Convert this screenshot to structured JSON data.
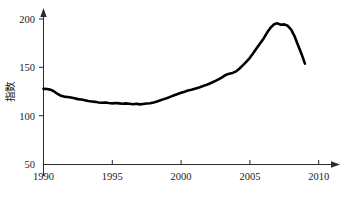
{
  "chart_data": {
    "type": "line",
    "title": "",
    "subtitle": "",
    "xlabel": "",
    "ylabel": "指数",
    "xlim": [
      1990,
      2010
    ],
    "ylim": [
      50,
      200
    ],
    "x_ticks": [
      1990,
      1995,
      2000,
      2005,
      2010
    ],
    "x_tick_labels": [
      "1990",
      "1995",
      "2000",
      "2005",
      "2010"
    ],
    "y_ticks": [
      50,
      100,
      150,
      200
    ],
    "y_tick_labels": [
      "50",
      "100",
      "150",
      "200"
    ],
    "grid": false,
    "legend": false,
    "legend_position": "none",
    "line_color": "#000000",
    "axis_color": "#2b2b2b",
    "series": [
      {
        "name": "指数",
        "x": [
          1990.0,
          1990.25,
          1990.5,
          1990.75,
          1991.0,
          1991.25,
          1991.5,
          1991.75,
          1992.0,
          1992.25,
          1992.5,
          1992.75,
          1993.0,
          1993.25,
          1993.5,
          1993.75,
          1994.0,
          1994.25,
          1994.5,
          1994.75,
          1995.0,
          1995.25,
          1995.5,
          1995.75,
          1996.0,
          1996.25,
          1996.5,
          1996.75,
          1997.0,
          1997.25,
          1997.5,
          1997.75,
          1998.0,
          1998.25,
          1998.5,
          1998.75,
          1999.0,
          1999.25,
          1999.5,
          1999.75,
          2000.0,
          2000.25,
          2000.5,
          2000.75,
          2001.0,
          2001.25,
          2001.5,
          2001.75,
          2002.0,
          2002.25,
          2002.5,
          2002.75,
          2003.0,
          2003.25,
          2003.5,
          2003.75,
          2004.0,
          2004.25,
          2004.5,
          2004.75,
          2005.0,
          2005.25,
          2005.5,
          2005.75,
          2006.0,
          2006.25,
          2006.5,
          2006.75,
          2007.0,
          2007.25,
          2007.5,
          2007.75,
          2008.0,
          2008.25,
          2008.5,
          2008.75,
          2009.0
        ],
        "values": [
          128.0,
          127.8,
          127.2,
          125.5,
          123.0,
          121.0,
          120.0,
          119.6,
          119.0,
          118.2,
          117.4,
          117.0,
          116.2,
          115.4,
          115.0,
          114.6,
          114.0,
          113.6,
          114.0,
          113.4,
          113.0,
          113.4,
          113.0,
          112.6,
          113.0,
          112.6,
          112.2,
          112.6,
          112.0,
          112.4,
          112.8,
          113.2,
          114.0,
          115.0,
          116.2,
          117.4,
          118.6,
          120.0,
          121.4,
          122.6,
          124.0,
          125.0,
          126.2,
          127.0,
          128.0,
          129.0,
          130.4,
          131.6,
          133.0,
          134.6,
          136.2,
          138.0,
          140.0,
          142.4,
          143.6,
          144.4,
          146.0,
          149.0,
          152.5,
          156.0,
          160.0,
          165.0,
          170.0,
          175.0,
          180.0,
          186.0,
          191.0,
          194.5,
          195.5,
          194.0,
          194.5,
          193.0,
          189.0,
          182.0,
          173.0,
          164.0,
          154.0
        ]
      }
    ],
    "annotations": {
      "start_value": 128,
      "trough_value": 112,
      "trough_year": 1997,
      "peak_value": 196,
      "peak_year": 2006,
      "end_value": 154,
      "end_year": 2009
    }
  },
  "axis": {
    "y_label": "指数",
    "x_tick_1": "1990",
    "x_tick_2": "1995",
    "x_tick_3": "2000",
    "x_tick_4": "2005",
    "x_tick_5": "2010",
    "y_tick_1": "50",
    "y_tick_2": "100",
    "y_tick_3": "150",
    "y_tick_4": "200"
  }
}
